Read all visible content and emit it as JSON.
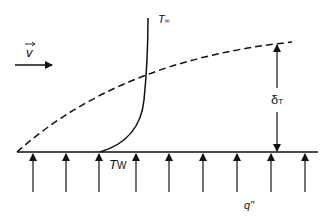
{
  "diagram": {
    "type": "thermal boundary layer over heated flat plate",
    "labels": {
      "velocity": "v",
      "free_stream_temp": "T",
      "free_stream_sub": "∞",
      "wall_temp": "T",
      "wall_sub": "W",
      "thickness": "δ",
      "thickness_sub": "T",
      "heat_flux": "q\""
    },
    "colors": {
      "stroke": "#111111",
      "background": "#ffffff"
    },
    "elements": {
      "plate": "solid horizontal line (heated wall)",
      "boundary_layer_edge": "dashed curve growing from leading edge",
      "temperature_profile": "solid curve from wall temperature to free stream",
      "thickness_indicator": "double-headed vertical arrow",
      "heat_flux_arrows_count": 9
    }
  }
}
